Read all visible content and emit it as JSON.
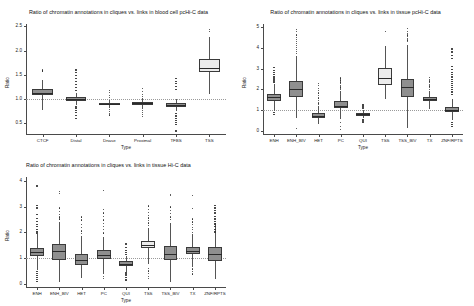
{
  "page": {
    "background": "#ffffff",
    "box_fill_default": "#8f8f8f",
    "box_fill_highlight": "#ececec",
    "box_border": "#3a3a3a",
    "median_color": "#2a2a2a",
    "axis_color": "#4a4a4a",
    "refline_color": "#9a9a9a",
    "refline_value": 1
  },
  "chart_data": [
    {
      "id": "chart1",
      "type": "box",
      "title": "Ratio of chromatin annotations in cliques vs. links in blood cell pcHi-C data",
      "xlabel": "Type",
      "ylabel": "Ratio",
      "ylim": [
        0.28,
        2.55
      ],
      "yticks": [
        0.5,
        1.0,
        1.5,
        2.0,
        2.5
      ],
      "ytick_labels": [
        "0.5",
        "1.0",
        "1.5",
        "2.0",
        "2.5"
      ],
      "grid": false,
      "legend": "none",
      "categories": [
        "CTCF",
        "Distal",
        "Dnase",
        "Proximal",
        "TFBS",
        "TSS"
      ],
      "boxes": [
        {
          "category": "CTCF",
          "q1": 1.08,
          "median": 1.13,
          "q3": 1.2,
          "whisker_low": 0.78,
          "whisker_high": 1.4,
          "highlight": false,
          "outliers": [
            1.58,
            1.6
          ]
        },
        {
          "category": "Distal",
          "q1": 0.96,
          "median": 1.0,
          "q3": 1.04,
          "whisker_low": 0.88,
          "whisker_high": 1.12,
          "highlight": false,
          "outliers": [
            1.6,
            1.55,
            1.48,
            1.42,
            1.36,
            1.3,
            1.24,
            1.18,
            0.84,
            0.8,
            0.76,
            0.72,
            0.66,
            0.6
          ]
        },
        {
          "category": "Dnase",
          "q1": 0.88,
          "median": 0.9,
          "q3": 0.93,
          "whisker_low": 0.82,
          "whisker_high": 0.99,
          "highlight": false,
          "outliers": [
            1.18,
            1.13,
            1.08,
            1.03,
            0.79,
            0.75,
            0.71,
            0.67
          ]
        },
        {
          "category": "Proximal",
          "q1": 0.88,
          "median": 0.91,
          "q3": 0.94,
          "whisker_low": 0.8,
          "whisker_high": 1.02,
          "highlight": false,
          "outliers": [
            1.22,
            1.16,
            1.1,
            1.05,
            0.76,
            0.72,
            0.68,
            0.64
          ]
        },
        {
          "category": "TFBS",
          "q1": 0.84,
          "median": 0.88,
          "q3": 0.92,
          "whisker_low": 0.76,
          "whisker_high": 1.0,
          "highlight": false,
          "outliers": [
            1.42,
            1.37,
            1.32,
            1.26,
            1.2,
            0.7,
            0.65,
            0.6,
            0.56,
            0.52,
            0.48,
            0.34
          ]
        },
        {
          "category": "TSS",
          "q1": 1.56,
          "median": 1.65,
          "q3": 1.82,
          "whisker_low": 1.1,
          "whisker_high": 2.28,
          "highlight": true,
          "outliers": [
            2.44,
            2.4
          ]
        }
      ]
    },
    {
      "id": "chart2",
      "type": "box",
      "title": "Ratio of chromatin annotations in cliques vs. links in tissue pcHi-C data",
      "xlabel": "Type",
      "ylabel": "Ratio",
      "ylim": [
        -0.15,
        5.15
      ],
      "yticks": [
        0,
        1,
        2,
        3,
        4,
        5
      ],
      "ytick_labels": [
        "0",
        "1",
        "2",
        "3",
        "4",
        "5"
      ],
      "grid": false,
      "legend": "none",
      "categories": [
        "ENH",
        "ENH_BIV",
        "HET",
        "PC",
        "QUI",
        "TSS",
        "TSS_BIV",
        "TX",
        "ZNF/RPTS"
      ],
      "boxes": [
        {
          "category": "ENH",
          "q1": 1.45,
          "median": 1.62,
          "q3": 1.78,
          "whisker_low": 0.95,
          "whisker_high": 2.25,
          "highlight": false,
          "outliers": [
            3.05,
            2.92,
            2.8,
            2.7,
            2.62,
            2.55,
            2.48,
            2.4,
            2.34,
            0.88,
            0.8
          ]
        },
        {
          "category": "ENH_BIV",
          "q1": 1.62,
          "median": 2.0,
          "q3": 2.42,
          "whisker_low": 0.62,
          "whisker_high": 3.6,
          "highlight": false,
          "outliers": [
            4.88,
            4.8,
            4.62,
            4.5,
            4.42,
            4.3,
            4.2,
            4.1,
            4.02,
            3.92,
            3.82,
            3.72,
            0.1
          ]
        },
        {
          "category": "HET",
          "q1": 0.62,
          "median": 0.72,
          "q3": 0.84,
          "whisker_low": 0.32,
          "whisker_high": 1.18,
          "highlight": false,
          "outliers": [
            2.3,
            2.18,
            2.05,
            1.95,
            1.82,
            1.7,
            1.58,
            1.46,
            1.35,
            1.26
          ]
        },
        {
          "category": "PC",
          "q1": 1.08,
          "median": 1.22,
          "q3": 1.42,
          "whisker_low": 0.55,
          "whisker_high": 1.9,
          "highlight": false,
          "outliers": [
            2.55,
            2.45,
            2.36,
            2.28,
            2.2,
            2.12,
            2.04,
            1.98,
            0.42,
            0.22,
            0.08
          ]
        },
        {
          "category": "QUI",
          "q1": 0.74,
          "median": 0.8,
          "q3": 0.88,
          "whisker_low": 0.62,
          "whisker_high": 1.02,
          "highlight": false,
          "outliers": [
            1.28,
            1.22,
            1.16,
            1.1,
            0.55,
            0.48,
            0.4
          ]
        },
        {
          "category": "TSS",
          "q1": 2.22,
          "median": 2.55,
          "q3": 3.02,
          "whisker_low": 1.52,
          "whisker_high": 4.1,
          "highlight": true,
          "outliers": [
            4.78
          ]
        },
        {
          "category": "TSS_BIV",
          "q1": 1.62,
          "median": 2.1,
          "q3": 2.5,
          "whisker_low": 0.12,
          "whisker_high": 4.12,
          "highlight": false,
          "outliers": [
            4.92,
            4.8,
            4.7,
            4.62,
            4.54,
            4.46,
            4.38,
            4.3
          ]
        },
        {
          "category": "TX",
          "q1": 1.42,
          "median": 1.52,
          "q3": 1.62,
          "whisker_low": 1.05,
          "whisker_high": 1.92,
          "highlight": false,
          "outliers": [
            2.58,
            2.48,
            2.4,
            2.32,
            2.24,
            2.16,
            2.08,
            2.0
          ]
        },
        {
          "category": "ZNF/RPTS",
          "q1": 0.9,
          "median": 1.02,
          "q3": 1.16,
          "whisker_low": 0.52,
          "whisker_high": 1.55,
          "highlight": false,
          "outliers": [
            3.95,
            3.8,
            3.62,
            3.48,
            3.1,
            2.95,
            2.82,
            2.7,
            2.6,
            2.48,
            2.38,
            2.28,
            2.18,
            2.08,
            1.98,
            1.88,
            1.76,
            0.4,
            0.3,
            0.2
          ]
        }
      ]
    },
    {
      "id": "chart3",
      "type": "box",
      "title": "Ratio of chromatin annotations in cliques vs. links in tissue Hi-C data",
      "xlabel": "Type",
      "ylabel": "Ratio",
      "ylim": [
        -0.12,
        4.15
      ],
      "yticks": [
        0,
        1,
        2,
        3,
        4
      ],
      "ytick_labels": [
        "0",
        "1",
        "2",
        "3",
        "4"
      ],
      "grid": false,
      "legend": "none",
      "categories": [
        "ENH",
        "ENH_BIV",
        "HET",
        "PC",
        "QUI",
        "TSS",
        "TSS_BIV",
        "TX",
        "ZNF/RPTS"
      ],
      "boxes": [
        {
          "category": "ENH",
          "q1": 1.1,
          "median": 1.25,
          "q3": 1.38,
          "whisker_low": 0.55,
          "whisker_high": 1.92,
          "highlight": false,
          "outliers": [
            3.8,
            3.05,
            2.95,
            2.7,
            2.55,
            2.42,
            2.3,
            2.22,
            2.12,
            2.04,
            1.98,
            0.48,
            0.4,
            0.32,
            0.25,
            0.18,
            0.1
          ]
        },
        {
          "category": "ENH_BIV",
          "q1": 0.92,
          "median": 1.28,
          "q3": 1.55,
          "whisker_low": 0.06,
          "whisker_high": 2.42,
          "highlight": false,
          "outliers": [
            3.58,
            3.52,
            2.95,
            2.82,
            2.7,
            2.6,
            2.52
          ]
        },
        {
          "category": "HET",
          "q1": 0.72,
          "median": 0.92,
          "q3": 1.18,
          "whisker_low": 0.22,
          "whisker_high": 1.85,
          "highlight": false,
          "outliers": [
            2.6,
            2.48,
            2.3,
            2.2,
            2.05,
            1.95
          ]
        },
        {
          "category": "PC",
          "q1": 0.95,
          "median": 1.12,
          "q3": 1.3,
          "whisker_low": 0.38,
          "whisker_high": 1.82,
          "highlight": false,
          "outliers": [
            3.62,
            2.9,
            2.75,
            2.62,
            2.48,
            2.35,
            2.22,
            2.1,
            1.98,
            0.3,
            0.22
          ]
        },
        {
          "category": "QUI",
          "q1": 0.68,
          "median": 0.78,
          "q3": 0.88,
          "whisker_low": 0.48,
          "whisker_high": 1.08,
          "highlight": false,
          "outliers": [
            1.55,
            1.42,
            1.3,
            1.22,
            1.15,
            0.42,
            0.34,
            0.26,
            0.18,
            0.12
          ]
        },
        {
          "category": "TSS",
          "q1": 1.38,
          "median": 1.52,
          "q3": 1.65,
          "whisker_low": 0.78,
          "whisker_high": 2.18,
          "highlight": true,
          "outliers": [
            3.02,
            2.88,
            2.76,
            2.66,
            2.56,
            2.46,
            2.36,
            2.28,
            0.6,
            0.5,
            0.4,
            0.3,
            0.2
          ]
        },
        {
          "category": "TSS_BIV",
          "q1": 0.92,
          "median": 1.18,
          "q3": 1.48,
          "whisker_low": 0.08,
          "whisker_high": 2.35,
          "highlight": false,
          "outliers": [
            3.48,
            3.42,
            2.98,
            2.85,
            2.72,
            2.6,
            2.5
          ]
        },
        {
          "category": "TX",
          "q1": 1.15,
          "median": 1.28,
          "q3": 1.42,
          "whisker_low": 0.65,
          "whisker_high": 1.92,
          "highlight": false,
          "outliers": [
            3.42,
            2.92,
            2.52,
            2.4,
            2.3,
            2.2,
            2.1,
            2.0,
            0.58,
            0.48,
            0.38
          ]
        },
        {
          "category": "ZNF/RPTS",
          "q1": 0.9,
          "median": 1.15,
          "q3": 1.42,
          "whisker_low": 0.2,
          "whisker_high": 2.35,
          "highlight": false,
          "outliers": [
            3.05,
            2.95,
            2.85,
            2.75,
            2.62,
            2.52,
            2.42,
            2.32,
            2.22,
            2.12,
            2.02
          ]
        }
      ]
    }
  ]
}
